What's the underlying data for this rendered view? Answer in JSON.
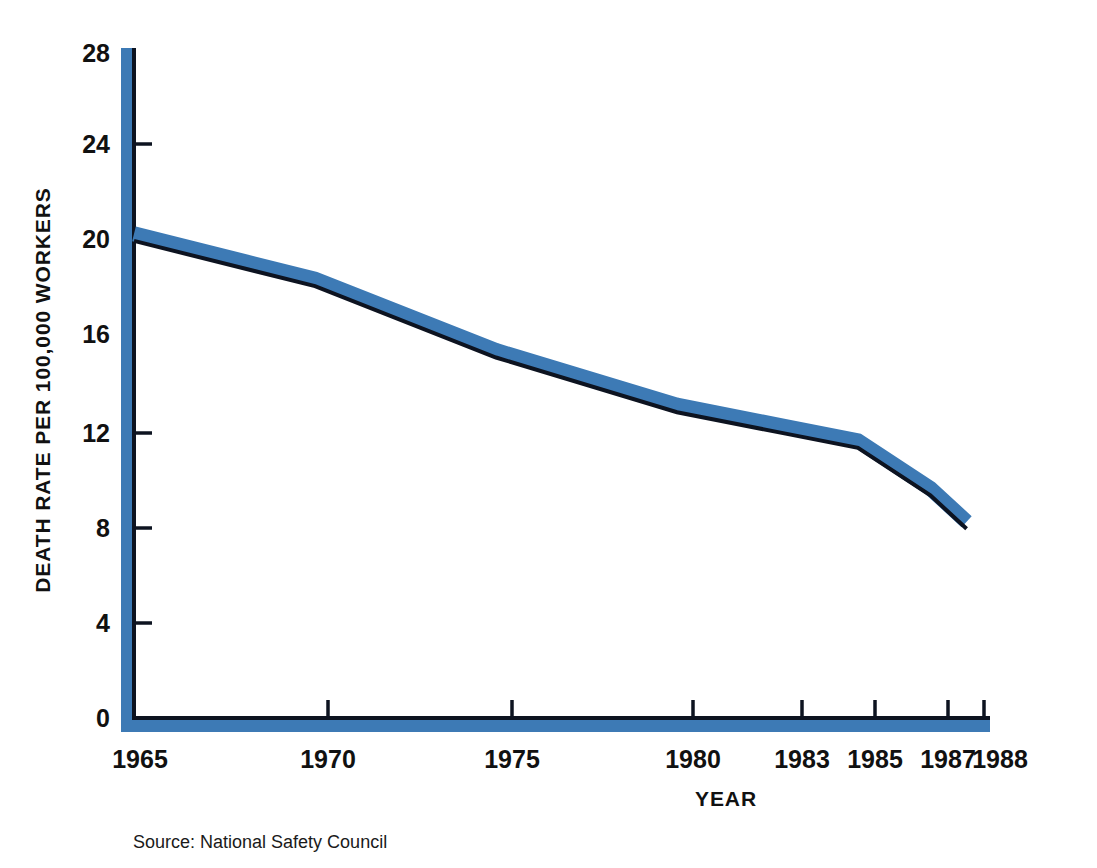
{
  "chart_data": {
    "type": "line",
    "title": "",
    "subtitle": "",
    "xlabel": "YEAR",
    "ylabel": "DEATH RATE PER 100,000 WORKERS",
    "x": [
      1965,
      1970,
      1975,
      1980,
      1983,
      1985,
      1987,
      1988
    ],
    "values": [
      20.1,
      18.2,
      15.2,
      12.9,
      12.0,
      11.4,
      9.4,
      8.0
    ],
    "series": [
      {
        "name": "Death rate per 100,000 workers",
        "values": [
          20.1,
          18.2,
          15.2,
          12.9,
          12.0,
          11.4,
          9.4,
          8.0
        ]
      }
    ],
    "xlim": [
      1965,
      1988
    ],
    "ylim": [
      0,
      28
    ],
    "ytick_values": [
      0,
      4,
      8,
      12,
      16,
      20,
      24,
      28
    ],
    "ytick_labels": [
      "0",
      "4",
      "8",
      "12",
      "16",
      "20",
      "24",
      "28"
    ],
    "xtick_values": [
      1965,
      1970,
      1975,
      1980,
      1983,
      1985,
      1987,
      1988
    ],
    "xtick_labels": [
      "1965",
      "1970",
      "1975",
      "1980",
      "1983",
      "1985",
      "1987",
      "1988"
    ],
    "grid": false,
    "legend": "none",
    "colors": {
      "line_band": "#3d7ab5",
      "line_edge": "#0d1320",
      "axis": "#0d1320",
      "axis_shadow": "#3d7ab5",
      "background": "#ffffff",
      "text": "#111111"
    }
  },
  "annotations": {
    "source": "Source: National Safety Council"
  },
  "axis_labels": {
    "y_title": "DEATH RATE PER 100,000 WORKERS",
    "x_title": "YEAR"
  },
  "ticks": {
    "y": [
      {
        "label": "28",
        "value": 28
      },
      {
        "label": "24",
        "value": 24
      },
      {
        "label": "20",
        "value": 20
      },
      {
        "label": "16",
        "value": 16
      },
      {
        "label": "12",
        "value": 12
      },
      {
        "label": "8",
        "value": 8
      },
      {
        "label": "4",
        "value": 4
      },
      {
        "label": "0",
        "value": 0
      }
    ],
    "x": [
      {
        "label": "1965",
        "value": 1965
      },
      {
        "label": "1970",
        "value": 1970
      },
      {
        "label": "1975",
        "value": 1975
      },
      {
        "label": "1980",
        "value": 1980
      },
      {
        "label": "1983",
        "value": 1983
      },
      {
        "label": "1985",
        "value": 1985
      },
      {
        "label": "1987",
        "value": 1987
      },
      {
        "label": "1988",
        "value": 1988
      }
    ]
  }
}
